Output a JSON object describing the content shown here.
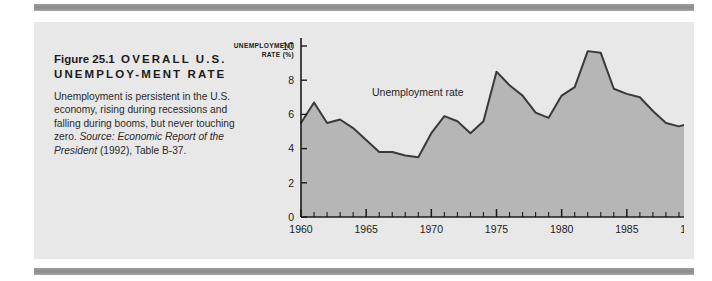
{
  "figure": {
    "number_label": "Figure 25.1",
    "title_caps": "OVERALL U.S. UNEMPLOY-MENT RATE",
    "caption_lead": "Unemployment is persistent in the U.S. economy, rising during recessions and falling during booms, but never touching zero. ",
    "source_label": "Source:",
    "source_title": " Economic Report of the President",
    "source_rest": " (1992), Table B-37."
  },
  "colors": {
    "panel_background": "#e8e8e8",
    "area_fill": "#b6b6b6",
    "line": "#3a3a3a",
    "axis": "#1b1b1b",
    "rule": "#929292",
    "text": "#1b1b1b"
  },
  "chart_data": {
    "type": "area",
    "title": "",
    "series_label": "Unemployment rate",
    "xlabel": "",
    "ylabel": "UNEMPLOYMENT RATE (%)",
    "ylabel_lines": [
      "UNEMPLOYMENT",
      "RATE (%)"
    ],
    "xlim": [
      1960,
      1990
    ],
    "ylim": [
      0,
      10
    ],
    "yticks": [
      0,
      2,
      4,
      6,
      8,
      10
    ],
    "ytick_labels": [
      "0",
      "2",
      "4",
      "6",
      "8",
      "10"
    ],
    "xticks": [
      1960,
      1965,
      1970,
      1975,
      1980,
      1985,
      1990
    ],
    "xtick_labels": [
      "1960",
      "1965",
      "1970",
      "1975",
      "1980",
      "1985",
      "1990"
    ],
    "x_minor_tick_interval": 1,
    "grid": false,
    "legend": "inline-annotation",
    "x": [
      1960,
      1961,
      1962,
      1963,
      1964,
      1965,
      1966,
      1967,
      1968,
      1969,
      1970,
      1971,
      1972,
      1973,
      1974,
      1975,
      1976,
      1977,
      1978,
      1979,
      1980,
      1981,
      1982,
      1983,
      1984,
      1985,
      1986,
      1987,
      1988,
      1989,
      1990
    ],
    "values": [
      5.5,
      6.7,
      5.5,
      5.7,
      5.2,
      4.5,
      3.8,
      3.8,
      3.6,
      3.5,
      4.9,
      5.9,
      5.6,
      4.9,
      5.6,
      8.5,
      7.7,
      7.1,
      6.1,
      5.8,
      7.1,
      7.6,
      9.7,
      9.6,
      7.5,
      7.2,
      7.0,
      6.2,
      5.5,
      5.3,
      5.5
    ],
    "units": "percent"
  }
}
